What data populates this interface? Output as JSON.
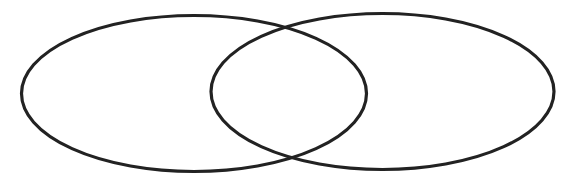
{
  "diagram": {
    "type": "venn",
    "background": "#ffffff",
    "stroke_color": "#222222",
    "stroke_width": 3.2,
    "sets": [
      {
        "id": "left",
        "cx": 194,
        "cy": 93.5,
        "rx": 172.5,
        "ry": 78
      },
      {
        "id": "right",
        "cx": 382.5,
        "cy": 91.5,
        "rx": 171.5,
        "ry": 78
      }
    ]
  }
}
